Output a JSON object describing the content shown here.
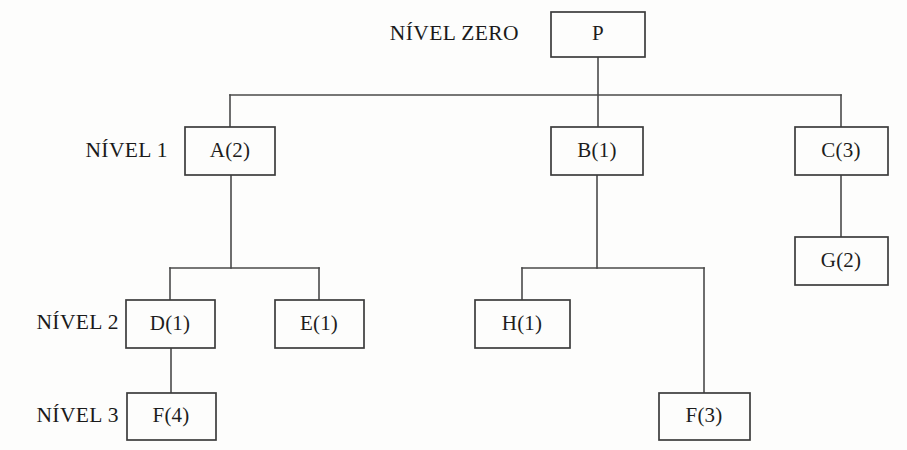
{
  "diagram": {
    "kind": "bill-of-materials-tree",
    "width": 907,
    "height": 450,
    "background_color": "#fdfdfc",
    "line_color": "#4a4a4a",
    "box_stroke_color": "#3c3c3c",
    "text_color": "#1d1d1d"
  },
  "level_labels": [
    {
      "id": "level-zero",
      "text": "NÍVEL ZERO",
      "x": 519,
      "y": 35
    },
    {
      "id": "level-1",
      "text": "NÍVEL 1",
      "x": 168,
      "y": 152
    },
    {
      "id": "level-2",
      "text": "NÍVEL 2",
      "x": 119,
      "y": 324
    },
    {
      "id": "level-3",
      "text": "NÍVEL 3",
      "x": 119,
      "y": 417
    }
  ],
  "nodes": [
    {
      "id": "node-p",
      "label": "P",
      "level": 0,
      "x": 551,
      "y": 12,
      "w": 94,
      "h": 45,
      "cx": 598,
      "cy": 34.5
    },
    {
      "id": "node-a",
      "label": "A(2)",
      "level": 1,
      "x": 185,
      "y": 127,
      "w": 90,
      "h": 48,
      "cx": 230,
      "cy": 151
    },
    {
      "id": "node-b",
      "label": "B(1)",
      "level": 1,
      "x": 551,
      "y": 127,
      "w": 92,
      "h": 48,
      "cx": 597,
      "cy": 151
    },
    {
      "id": "node-c",
      "label": "C(3)",
      "level": 1,
      "x": 795,
      "y": 127,
      "w": 93,
      "h": 48,
      "cx": 841,
      "cy": 151
    },
    {
      "id": "node-g",
      "label": "G(2)",
      "level": 2,
      "x": 795,
      "y": 237,
      "w": 93,
      "h": 48,
      "cx": 841,
      "cy": 261
    },
    {
      "id": "node-d",
      "label": "D(1)",
      "level": 2,
      "x": 126,
      "y": 300,
      "w": 89,
      "h": 48,
      "cx": 170,
      "cy": 324
    },
    {
      "id": "node-e",
      "label": "E(1)",
      "level": 2,
      "x": 275,
      "y": 300,
      "w": 89,
      "h": 48,
      "cx": 319,
      "cy": 324
    },
    {
      "id": "node-h",
      "label": "H(1)",
      "level": 2,
      "x": 475,
      "y": 300,
      "w": 95,
      "h": 48,
      "cx": 522,
      "cy": 324
    },
    {
      "id": "node-f4",
      "label": "F(4)",
      "level": 3,
      "x": 127,
      "y": 393,
      "w": 89,
      "h": 47,
      "cx": 171,
      "cy": 416
    },
    {
      "id": "node-f3",
      "label": "F(3)",
      "level": 3,
      "x": 659,
      "y": 393,
      "w": 91,
      "h": 47,
      "cx": 704,
      "cy": 416
    }
  ],
  "connectors": [
    {
      "id": "conn-p-drop",
      "points": "598,57 598,127"
    },
    {
      "id": "conn-level1-bus",
      "points": "230,95 841,95"
    },
    {
      "id": "conn-a-riser",
      "points": "230,95 230,127"
    },
    {
      "id": "conn-c-riser",
      "points": "841,95 841,127"
    },
    {
      "id": "conn-a-drop",
      "points": "231,175 231,268"
    },
    {
      "id": "conn-a-children-bus",
      "points": "170,268 319,268"
    },
    {
      "id": "conn-d-riser",
      "points": "170,268 170,300"
    },
    {
      "id": "conn-e-riser",
      "points": "319,268 319,300"
    },
    {
      "id": "conn-d-f4",
      "points": "171,348 171,393"
    },
    {
      "id": "conn-b-drop",
      "points": "597,175 597,268"
    },
    {
      "id": "conn-b-children-bus",
      "points": "522,268 704,268"
    },
    {
      "id": "conn-h-riser",
      "points": "522,268 522,300"
    },
    {
      "id": "conn-f3-riser",
      "points": "704,268 704,393"
    },
    {
      "id": "conn-c-g",
      "points": "841,175 841,237"
    }
  ],
  "tree_structure": {
    "root": "P",
    "edges": [
      {
        "parent": "P",
        "child": "A(2)"
      },
      {
        "parent": "P",
        "child": "B(1)"
      },
      {
        "parent": "P",
        "child": "C(3)"
      },
      {
        "parent": "A(2)",
        "child": "D(1)"
      },
      {
        "parent": "A(2)",
        "child": "E(1)"
      },
      {
        "parent": "B(1)",
        "child": "H(1)"
      },
      {
        "parent": "B(1)",
        "child": "F(3)"
      },
      {
        "parent": "C(3)",
        "child": "G(2)"
      },
      {
        "parent": "D(1)",
        "child": "F(4)"
      }
    ]
  }
}
